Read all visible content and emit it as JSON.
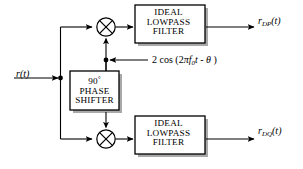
{
  "diagram": {
    "background_color": "#ffffff",
    "line_color": "#000000",
    "box_border_color": "#000000",
    "box_shadow_color": "#a8a8a8",
    "input": {
      "label_r": "r",
      "label_paren_t": "(t)"
    },
    "top_filter": {
      "line1": "IDEAL",
      "line2": "LOWPASS",
      "line3": "FILTER"
    },
    "bottom_filter": {
      "line1": "IDEAL",
      "line2": "LOWPASS",
      "line3": "FILTER"
    },
    "phase_shifter": {
      "line1_value": "90",
      "line1_degree": "°",
      "line2": "PHASE",
      "line3": "SHIFTER"
    },
    "carrier": {
      "amplitude": "2",
      "func": "cos",
      "open_paren": "(",
      "two": "2",
      "pi": "π",
      "f_symbol": "f",
      "f_subscript": "0",
      "t_symbol": "t",
      "minus": "-",
      "theta": "θ",
      "close_paren": ")",
      "full_text": "2 cos (2πf0 t - θ )"
    },
    "top_output": {
      "symbol": "r",
      "subscript": "DP",
      "arg": "(t)"
    },
    "bottom_output": {
      "symbol": "r",
      "subscript": "DQ",
      "arg": "(t)"
    },
    "multiplier_glyph": "⊗"
  }
}
